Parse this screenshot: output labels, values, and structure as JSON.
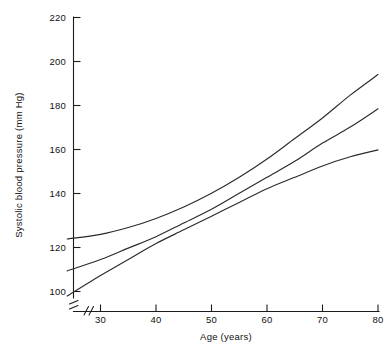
{
  "chart_data": {
    "type": "line",
    "title": "",
    "xlabel": "Age (years)",
    "ylabel": "Systolic blood pressure (mm Hg)",
    "xlim": [
      24,
      80
    ],
    "ylim": [
      96,
      220
    ],
    "x_ticks": [
      30,
      40,
      50,
      60,
      70,
      80
    ],
    "y_ticks": [
      100,
      120,
      140,
      160,
      180,
      200,
      220
    ],
    "x_tick_labels": [
      "30",
      "40",
      "50",
      "60",
      "70",
      "80"
    ],
    "y_tick_labels": [
      "100",
      "120",
      "140",
      "160",
      "180",
      "200",
      "220"
    ],
    "grid": false,
    "legend": "none",
    "axis_break_x": true,
    "axis_break_y": true,
    "series": [
      {
        "name": "upper-curve",
        "x": [
          24,
          30,
          35,
          40,
          45,
          50,
          55,
          60,
          65,
          70,
          75,
          80
        ],
        "values": [
          123,
          125,
          128,
          132,
          137,
          143,
          150,
          158,
          167,
          176,
          186,
          195
        ]
      },
      {
        "name": "middle-curve",
        "x": [
          24,
          30,
          35,
          40,
          45,
          50,
          55,
          60,
          65,
          70,
          75,
          80
        ],
        "values": [
          109,
          114,
          119,
          124,
          130,
          136,
          143,
          150,
          157,
          165,
          172,
          180
        ]
      },
      {
        "name": "lower-curve",
        "x": [
          24,
          30,
          35,
          40,
          45,
          50,
          55,
          60,
          65,
          70,
          75,
          80
        ],
        "values": [
          98,
          107,
          114,
          121,
          127,
          133,
          139,
          145,
          150,
          155,
          159,
          162
        ]
      }
    ]
  },
  "figure": {
    "ylabel": "Systolic blood pressure (mm Hg)",
    "xlabel": "Age (years)"
  }
}
